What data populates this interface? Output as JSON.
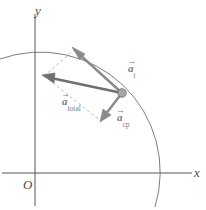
{
  "figure": {
    "background_color": "#ffffff",
    "width": 206,
    "height": 210
  },
  "axes": {
    "x_label": "x",
    "y_label": "y",
    "origin_label": "O",
    "axis_color": "#555555",
    "x_axis_y": 173,
    "y_axis_x": 35,
    "x_axis_from": 2,
    "x_axis_to": 192,
    "y_axis_from": 14,
    "y_axis_to": 206
  },
  "circle": {
    "name": "circular-path-arc",
    "center_x": 35,
    "center_y": 173,
    "radius": 120,
    "color": "#6e6e6e"
  },
  "particle": {
    "name": "particle-marker",
    "x": 122,
    "y": 93,
    "radius": 4.2,
    "fill": "#a8a8a8",
    "stroke": "#777777"
  },
  "vectors": [
    {
      "id": "a_t",
      "label_base": "a",
      "label_sub": "t",
      "label_arrow": "→",
      "from_x": 122,
      "from_y": 93,
      "to_x": 74,
      "to_y": 50,
      "color": "#8a8a8a"
    },
    {
      "id": "a_total",
      "label_base": "a",
      "label_sub": "total",
      "label_arrow": "→",
      "from_x": 122,
      "from_y": 93,
      "to_x": 44,
      "to_y": 76,
      "color": "#6f6f6f"
    },
    {
      "id": "a_cp",
      "label_base": "a",
      "label_sub": "cp",
      "label_arrow": "→",
      "from_x": 122,
      "from_y": 93,
      "to_x": 101,
      "to_y": 121,
      "color": "#8a8a8a"
    }
  ],
  "construction": {
    "name": "parallelogram-dashed-lines",
    "color": "#b0b0b0",
    "dash": "3,2.5"
  }
}
